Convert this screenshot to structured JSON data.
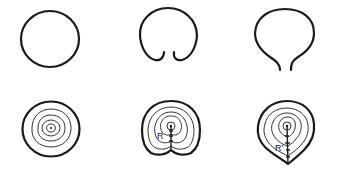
{
  "figure": {
    "top_row": [
      {
        "id": "closed-circle",
        "description": "closed round outline"
      },
      {
        "id": "notched-outline",
        "description": "round outline with inward-curled notch at bottom"
      },
      {
        "id": "stemmed-outline",
        "description": "round outline tapering into open stem at bottom"
      }
    ],
    "bottom_row": [
      {
        "id": "concentric-rings",
        "description": "concentric growth rings around central point"
      },
      {
        "id": "notched-rings",
        "description": "growth rings with raphe-like line from center to notch",
        "label": "R"
      },
      {
        "id": "pointed-rings",
        "description": "growth rings with line from center to pointed base",
        "label": "R'"
      }
    ],
    "colors": {
      "stroke": "#1a1a1a",
      "background": "#ffffff"
    }
  }
}
